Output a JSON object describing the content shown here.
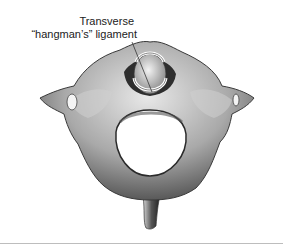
{
  "figure": {
    "label": {
      "line1": "Transverse",
      "line2": "“hangman’s” ligament"
    }
  }
}
